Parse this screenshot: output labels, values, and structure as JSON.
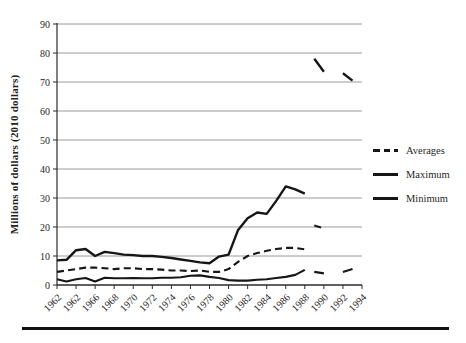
{
  "chart_data": {
    "type": "line",
    "title": "",
    "xlabel": "",
    "ylabel": "Millions of dollars (2010 dollars)",
    "ylim": [
      0,
      90
    ],
    "x_range": [
      1962,
      1994
    ],
    "grid": true,
    "legend_position": "right",
    "y_ticks": [
      0,
      10,
      20,
      30,
      40,
      50,
      60,
      70,
      80,
      90
    ],
    "y_tick_labels": [
      "0",
      "10",
      "20",
      "30",
      "40",
      "50",
      "60",
      "70",
      "80",
      "90"
    ],
    "x_tick_years": [
      1962,
      1964,
      1966,
      1968,
      1970,
      1972,
      1974,
      1976,
      1978,
      1980,
      1982,
      1984,
      1986,
      1988,
      1990,
      1992,
      1994
    ],
    "x_tick_labels": [
      "1962",
      "1962",
      "1966",
      "1968",
      "1970",
      "1972",
      "1974",
      "1976",
      "1978",
      "1980",
      "1982",
      "1984",
      "1986",
      "1988",
      "1990",
      "1992",
      "1994"
    ],
    "years": [
      1962,
      1963,
      1964,
      1965,
      1966,
      1967,
      1968,
      1969,
      1970,
      1971,
      1972,
      1973,
      1974,
      1975,
      1976,
      1977,
      1978,
      1979,
      1980,
      1981,
      1982,
      1983,
      1984,
      1985,
      1986,
      1987,
      1988
    ],
    "series": [
      {
        "name": "Averages",
        "style": "dashed",
        "values": [
          4.5,
          5,
          5.5,
          6,
          6,
          5.8,
          5.5,
          5.8,
          5.8,
          5.5,
          5.5,
          5.3,
          5,
          5,
          4.8,
          5,
          4.5,
          4.5,
          5.5,
          8,
          10,
          11,
          11.8,
          12.4,
          12.8,
          12.8,
          12.3
        ],
        "post_gap_segments": [
          [
            [
              1989,
              20.5
            ],
            [
              1990,
              19.5
            ]
          ]
        ]
      },
      {
        "name": "Maximum",
        "style": "solid",
        "values": [
          8.5,
          8.7,
          12,
          12.4,
          10,
          11.4,
          11,
          10.5,
          10.3,
          10,
          10,
          9.7,
          9.3,
          8.8,
          8.3,
          7.8,
          7.5,
          9.8,
          10.5,
          19,
          23,
          25,
          24.5,
          29,
          34,
          33,
          31.5
        ],
        "post_gap_segments": [
          [
            [
              1989,
              78
            ],
            [
              1990,
              73.5
            ]
          ],
          [
            [
              1992,
              73
            ],
            [
              1993,
              70.5
            ]
          ]
        ]
      },
      {
        "name": "Minimum",
        "style": "solid",
        "values": [
          2,
          1.2,
          2,
          2.4,
          1.2,
          2.5,
          2.3,
          2.3,
          2.4,
          2.3,
          2.3,
          2.5,
          2.5,
          2.7,
          3.2,
          3.3,
          2.8,
          2.4,
          1.7,
          1.5,
          1.5,
          1.8,
          2,
          2.4,
          2.8,
          3.5,
          5.2
        ],
        "post_gap_segments": [
          [
            [
              1989,
              4.5
            ],
            [
              1990,
              4
            ]
          ],
          [
            [
              1992,
              4.5
            ],
            [
              1993,
              5.5
            ]
          ]
        ]
      }
    ],
    "legend": [
      {
        "label": "Averages",
        "style": "dashed"
      },
      {
        "label": "Maximum",
        "style": "solid"
      },
      {
        "label": "Minimum",
        "style": "solid"
      }
    ],
    "colors": {
      "line": "#161616",
      "grid": "#9a9a9a",
      "axis": "#2b2b2b",
      "text": "#1f1f1f"
    }
  }
}
